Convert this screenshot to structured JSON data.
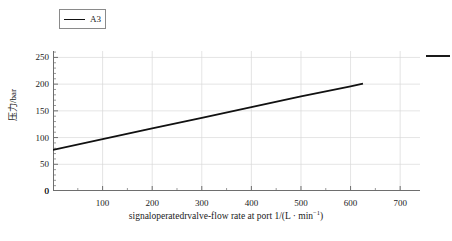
{
  "legend": {
    "entries": [
      {
        "label": "A3",
        "color": "#111111",
        "marker": "line"
      }
    ]
  },
  "axes": {
    "y_title": "压力/bar",
    "x_title_main": "signaloperatedrvalve-flow rate at port 1/(L · min",
    "x_title_sup": "−1",
    "x_title_tail": ")",
    "x_title_full": "signaloperatedrvalve-flow rate at port 1/(L · min⁻¹)",
    "y_ticks": [
      "0",
      "50",
      "100",
      "150",
      "200",
      "250"
    ],
    "x_ticks": [
      "0",
      "100",
      "200",
      "300",
      "400",
      "500",
      "600",
      "700"
    ]
  },
  "colors": {
    "series": "#111111",
    "grid": "#d9d9d9",
    "axis": "#6e6e6e",
    "text": "#1a1a1a",
    "background": "#ffffff"
  },
  "chart_data": {
    "type": "line",
    "title": "",
    "xlabel": "signaloperatedrvalve-flow rate at port 1/(L · min⁻¹)",
    "ylabel": "压力/bar",
    "xlim": [
      0,
      740
    ],
    "ylim": [
      0,
      262
    ],
    "xticks": [
      0,
      100,
      200,
      300,
      400,
      500,
      600,
      700
    ],
    "yticks": [
      0,
      50,
      100,
      150,
      200,
      250
    ],
    "grid": true,
    "legend_position": "above-left",
    "series": [
      {
        "name": "A3",
        "color": "#111111",
        "x": [
          0,
          100,
          200,
          300,
          400,
          500,
          600,
          625
        ],
        "values": [
          77,
          97,
          117,
          137,
          157,
          177,
          196,
          201
        ]
      }
    ],
    "annotations": [
      {
        "name": "right-edge-stub",
        "type": "line-segment",
        "x_px": [
          426,
          450
        ],
        "y_value": 235
      }
    ]
  }
}
